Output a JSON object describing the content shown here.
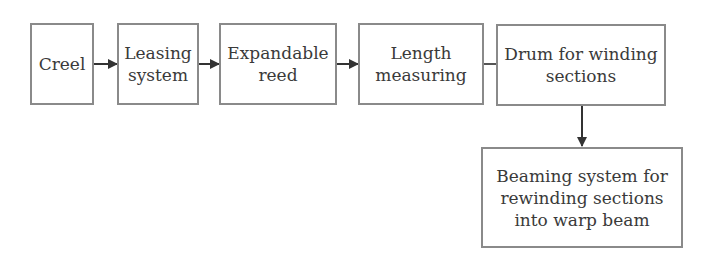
{
  "diagram": {
    "type": "flowchart",
    "nodes": [
      {
        "id": "creel",
        "label": "Creel"
      },
      {
        "id": "leasing",
        "label": "Leasing\nsystem"
      },
      {
        "id": "reed",
        "label": "Expandable\nreed"
      },
      {
        "id": "length",
        "label": "Length\nmeasuring"
      },
      {
        "id": "drum",
        "label": "Drum for winding\nsections"
      },
      {
        "id": "beaming",
        "label": "Beaming system for\nrewinding sections\ninto warp beam"
      }
    ],
    "edges": [
      {
        "from": "creel",
        "to": "leasing",
        "arrow": true
      },
      {
        "from": "leasing",
        "to": "reed",
        "arrow": true
      },
      {
        "from": "reed",
        "to": "length",
        "arrow": true
      },
      {
        "from": "length",
        "to": "drum",
        "arrow": false
      },
      {
        "from": "drum",
        "to": "beaming",
        "arrow": true
      }
    ],
    "colors": {
      "border": "#8a8a8a",
      "line": "#333333",
      "text": "#3a3a3a"
    }
  }
}
